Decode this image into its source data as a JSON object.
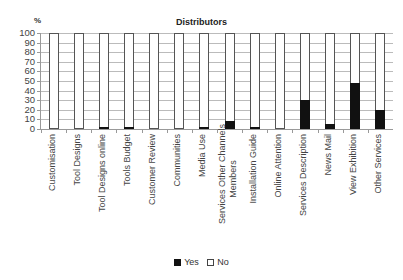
{
  "chart_data": {
    "type": "bar",
    "stacked": true,
    "percent": true,
    "title": "Distributors",
    "xlabel": "",
    "ylabel": "%",
    "ylim": [
      0,
      100
    ],
    "yticks": [
      0,
      10,
      20,
      30,
      40,
      50,
      60,
      70,
      80,
      90,
      100
    ],
    "grid": true,
    "legend_position": "bottom",
    "categories": [
      "Customisation",
      "Tool Designs",
      "Tool Designs online",
      "Tools Budget",
      "Customer Review",
      "Communities",
      "Media Use",
      "Services Other Channels Members",
      "Installation  Guide",
      "Online Attention",
      "Services Description",
      "News Mail",
      "View Exhibition",
      "Other Services"
    ],
    "series": [
      {
        "name": "Yes",
        "color": "#111111",
        "values": [
          0,
          0,
          2,
          2,
          0,
          0,
          2,
          8,
          2,
          0,
          30,
          5,
          48,
          20
        ]
      },
      {
        "name": "No",
        "color": "#ffffff",
        "values": [
          100,
          100,
          98,
          98,
          100,
          100,
          98,
          92,
          98,
          100,
          70,
          95,
          52,
          80
        ]
      }
    ]
  },
  "labels": {
    "title": "Distributors",
    "yunit": "%",
    "yticks": [
      "0",
      "10",
      "20",
      "30",
      "40",
      "50",
      "60",
      "70",
      "80",
      "90",
      "100"
    ],
    "legend_yes": "Yes",
    "legend_no": "No",
    "x": [
      [
        "Customisation"
      ],
      [
        "Tool Designs"
      ],
      [
        "Tool Designs online"
      ],
      [
        "Tools Budget"
      ],
      [
        "Customer Review"
      ],
      [
        "Communities"
      ],
      [
        "Media Use"
      ],
      [
        "Services Other Channels",
        "Members"
      ],
      [
        "Installation  Guide"
      ],
      [
        "Online Attention"
      ],
      [
        "Services Description"
      ],
      [
        "News Mail"
      ],
      [
        "View Exhibition"
      ],
      [
        "Other Services"
      ]
    ]
  }
}
